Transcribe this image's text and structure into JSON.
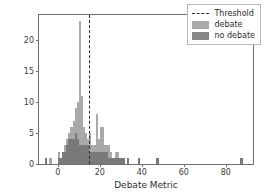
{
  "chart_data": {
    "type": "bar",
    "title": "",
    "xlabel": "Debate Metric",
    "ylabel": "Counts",
    "xlim": [
      -9,
      93
    ],
    "ylim": [
      0,
      24
    ],
    "xticks": [
      0,
      20,
      40,
      60,
      80
    ],
    "yticks": [
      0,
      5,
      10,
      15,
      20
    ],
    "grid": false,
    "legend_position": "upper right",
    "bin_width": 1.0,
    "annotations": [
      {
        "name": "threshold",
        "type": "vline",
        "x": 14.7,
        "style": "dashed",
        "color": "#2b2b2b",
        "label": "Threshold"
      }
    ],
    "series": [
      {
        "name": "debate",
        "color": "#969696",
        "alpha": 0.82,
        "x": [
          -6,
          -4,
          0,
          1,
          2,
          3,
          4,
          5,
          6,
          7,
          8,
          9,
          10,
          11,
          12,
          13,
          14,
          15,
          16,
          17,
          18,
          19,
          20,
          21,
          22,
          23,
          24,
          25,
          26,
          27,
          28,
          29,
          30,
          31,
          33,
          38,
          47,
          87
        ],
        "values": [
          1,
          1,
          2,
          1,
          2,
          3,
          4,
          5,
          6,
          7,
          9,
          10,
          23,
          11,
          6,
          5,
          4,
          5,
          3,
          3,
          8,
          4,
          6,
          6,
          3,
          3,
          3,
          2,
          1,
          2,
          2,
          1,
          1,
          1,
          1,
          1,
          1,
          1
        ]
      },
      {
        "name": "no debate",
        "color": "#6e6e6e",
        "alpha": 0.82,
        "x": [
          -6,
          0,
          1,
          2,
          3,
          4,
          5,
          6,
          7,
          8,
          9,
          10,
          11,
          12,
          13,
          14,
          15,
          16,
          17,
          18,
          19,
          20,
          21,
          22,
          23,
          24,
          25,
          26,
          27,
          28,
          29,
          30,
          31,
          33,
          38,
          47,
          87
        ],
        "values": [
          1,
          1,
          1,
          2,
          2,
          3,
          4,
          4,
          4,
          5,
          4,
          3,
          3,
          3,
          3,
          3,
          2,
          2,
          2,
          2,
          2,
          2,
          2,
          2,
          2,
          1,
          1,
          1,
          1,
          1,
          1,
          1,
          1,
          1,
          1,
          1,
          1
        ]
      }
    ],
    "legend": [
      {
        "label": "Threshold",
        "marker": "dashed-line"
      },
      {
        "label": "debate",
        "marker": "swatch"
      },
      {
        "label": "no debate",
        "marker": "swatch"
      }
    ]
  }
}
